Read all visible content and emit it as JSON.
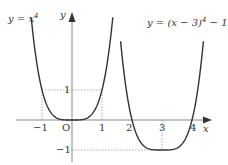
{
  "chart_data": {
    "type": "line",
    "title": "",
    "xlabel": "x",
    "ylabel": "y",
    "origin_label": "O",
    "xlim": [
      -1.5,
      5.0
    ],
    "ylim": [
      -1.2,
      4.0
    ],
    "grid": false,
    "x_ticks": [
      "-1",
      "1",
      "2",
      "3",
      "4"
    ],
    "y_ticks": [
      "1",
      "-1"
    ],
    "series": [
      {
        "name": "y = x^4",
        "label": "y = x⁴",
        "formula": "x^4",
        "points": [
          [
            -1.35,
            3.32
          ],
          [
            -1,
            1
          ],
          [
            0,
            0
          ],
          [
            1,
            1
          ],
          [
            1.35,
            3.32
          ]
        ]
      },
      {
        "name": "y = (x-3)^4 - 1",
        "label": "y = (x−3)⁴−1",
        "formula": "(x-3)^4-1",
        "points": [
          [
            1.6,
            2.84
          ],
          [
            2,
            0
          ],
          [
            3,
            -1
          ],
          [
            4,
            0
          ],
          [
            4.4,
            2.84
          ]
        ]
      }
    ],
    "guides": [
      {
        "from": [
          -1,
          0
        ],
        "to": [
          -1,
          1
        ],
        "style": "dotted"
      },
      {
        "from": [
          -1,
          1
        ],
        "to": [
          1,
          1
        ],
        "style": "dotted"
      },
      {
        "from": [
          1,
          0
        ],
        "to": [
          1,
          1
        ],
        "style": "dotted"
      },
      {
        "from": [
          0,
          -1
        ],
        "to": [
          3,
          -1
        ],
        "style": "dotted"
      },
      {
        "from": [
          3,
          0
        ],
        "to": [
          3,
          -1
        ],
        "style": "dotted"
      }
    ]
  },
  "labels": {
    "curve1": "y = x",
    "curve1_exp": "4",
    "curve2": "y = (x − 3)",
    "curve2_exp": "4",
    "curve2_tail": " − 1",
    "x_axis": "x",
    "y_axis": "y",
    "origin": "O",
    "tick_m1": "−1",
    "tick_1": "1",
    "tick_2": "2",
    "tick_3": "3",
    "tick_4": "4",
    "ytick_1": "1",
    "ytick_m1": "−1"
  }
}
